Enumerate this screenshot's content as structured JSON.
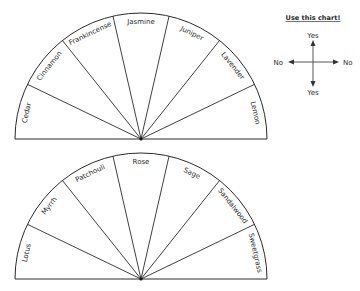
{
  "colors": {
    "ink": "#2a2a2a",
    "background": "#ffffff"
  },
  "charts": [
    {
      "id": "top",
      "slices": [
        "Cedar",
        "Cinnamon",
        "Frankincense",
        "Jasmine",
        "Juniper",
        "Lavender",
        "Lemon"
      ]
    },
    {
      "id": "bottom",
      "slices": [
        "Lotus",
        "Myrrh",
        "Patchouli",
        "Rose",
        "Sage",
        "Sandalwood",
        "Sweetgrass"
      ]
    }
  ],
  "legend": {
    "title": "Use this chart!",
    "top": "Yes",
    "bottom": "Yes",
    "left": "No",
    "right": "No"
  }
}
